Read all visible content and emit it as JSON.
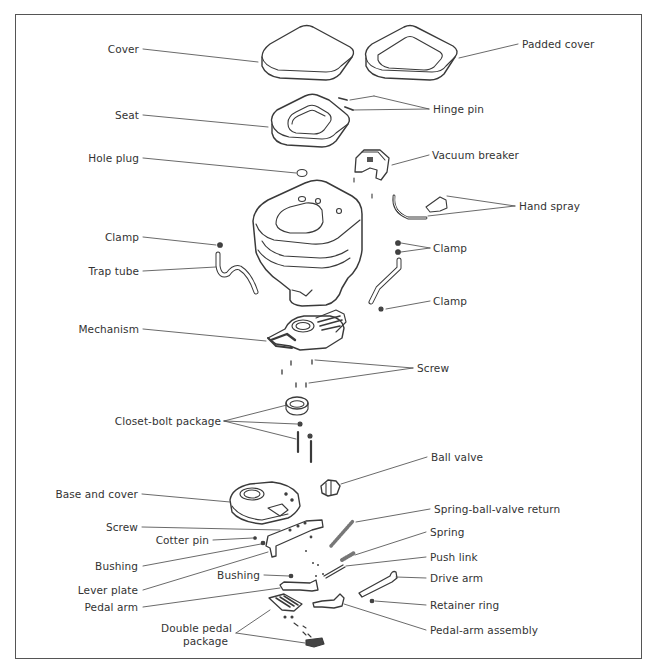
{
  "diagram": {
    "type": "exploded-parts-view",
    "labels_left": {
      "cover": "Cover",
      "seat": "Seat",
      "hole_plug": "Hole plug",
      "clamp": "Clamp",
      "trap_tube": "Trap tube",
      "mechanism": "Mechanism",
      "closet_bolt_package": "Closet-bolt package",
      "base_and_cover": "Base and cover",
      "screw": "Screw",
      "cotter_pin": "Cotter pin",
      "bushing": "Bushing",
      "lever_plate": "Lever plate",
      "bushing_2": "Bushing",
      "pedal_arm": "Pedal arm",
      "double_pedal_line1": "Double pedal",
      "double_pedal_line2": "package"
    },
    "labels_right": {
      "padded_cover": "Padded cover",
      "hinge_pin": "Hinge pin",
      "vacuum_breaker": "Vacuum breaker",
      "hand_spray": "Hand spray",
      "clamp_upper": "Clamp",
      "clamp_lower": "Clamp",
      "screw": "Screw",
      "ball_valve": "Ball valve",
      "spring_ball_valve_return": "Spring-ball-valve return",
      "spring": "Spring",
      "push_link": "Push link",
      "drive_arm": "Drive arm",
      "retainer_ring": "Retainer ring",
      "pedal_arm_assembly": "Pedal-arm assembly"
    },
    "colors": {
      "line": "#444444",
      "text": "#333333",
      "frame": "#555555",
      "fill": "#ffffff"
    }
  }
}
